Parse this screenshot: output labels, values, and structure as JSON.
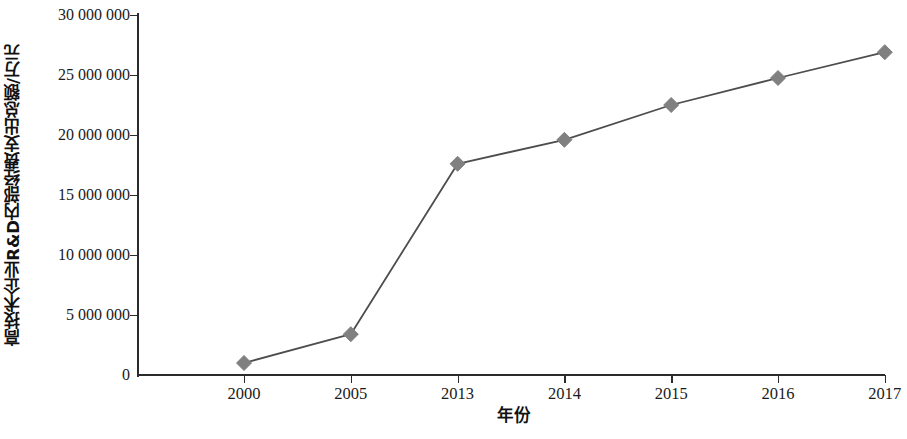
{
  "chart_data": {
    "type": "line",
    "title": "",
    "xlabel": "年份",
    "ylabel": "高技术企业R&D内部经费支出总额/万元",
    "categories": [
      "2000",
      "2005",
      "2013",
      "2014",
      "2015",
      "2016",
      "2017"
    ],
    "values": [
      1000000,
      3400000,
      17600000,
      19600000,
      22500000,
      24750000,
      26900000
    ],
    "series": [
      {
        "name": "高技术企业R&D内部经费支出总额",
        "values": [
          1000000,
          3400000,
          17600000,
          19600000,
          22500000,
          24750000,
          26900000
        ]
      }
    ],
    "ylim": [
      0,
      30000000
    ],
    "y_ticks": [
      0,
      5000000,
      10000000,
      15000000,
      20000000,
      25000000,
      30000000
    ],
    "y_tick_labels": [
      "0",
      "5 000 000",
      "10 000 000",
      "15 000 000",
      "20 000 000",
      "25 000 000",
      "30 000 000"
    ],
    "grid": false,
    "legend": "none",
    "marker": "diamond",
    "line_color": "#4d4d4d",
    "marker_color": "#808080",
    "axis_color": "#2b2b2b"
  }
}
